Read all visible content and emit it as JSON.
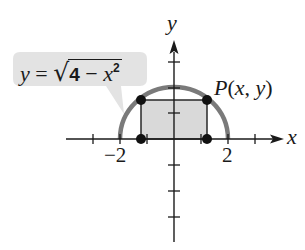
{
  "figure": {
    "equation_label": {
      "lhs": "y",
      "equals": "=",
      "radical": "√",
      "radicand_num": "4",
      "radicand_minus": "−",
      "radicand_var": "x",
      "radicand_exp": "2",
      "full_text": "y = √(4 − x²)"
    },
    "point_label": {
      "name": "P",
      "open": "(",
      "x": "x",
      "comma": ", ",
      "y": "y",
      "close": ")",
      "full_text": "P(x, y)"
    },
    "axes": {
      "x_label": "x",
      "y_label": "y",
      "x_tick_labels": [
        "−2",
        "2"
      ],
      "x_ticks": [
        -3,
        -2,
        -1,
        1,
        2,
        3
      ],
      "y_ticks": [
        -4,
        -3,
        -2,
        -1,
        1,
        2,
        3
      ]
    },
    "curve": {
      "type": "semicircle",
      "radius": 2,
      "color": "#7a7a7a"
    },
    "rectangle": {
      "x_half_width": 1.25,
      "height": 1.5,
      "fill": "#d9d9d9",
      "stroke": "#1a1a1a"
    },
    "callout_fill": "#e3e3e3",
    "points": [
      {
        "x": -1.25,
        "y": 1.5
      },
      {
        "x": 1.25,
        "y": 1.5
      },
      {
        "x": -1.25,
        "y": 0
      },
      {
        "x": 1.25,
        "y": 0
      }
    ]
  }
}
